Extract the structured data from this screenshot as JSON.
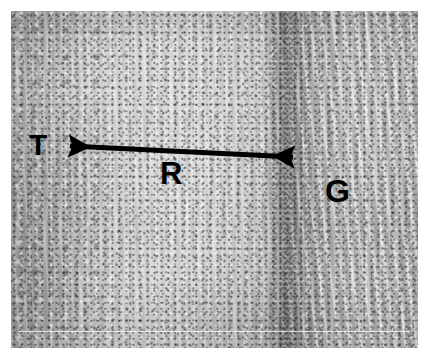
{
  "figure": {
    "kind": "histology-micrograph",
    "modality": "light microscopy, H&E-like grayscale tissue section",
    "background_color": "#ffffff",
    "annotation_color": "#000000",
    "canvas": {
      "x": 11,
      "y": 11,
      "width": 407,
      "height": 337
    },
    "tone_zones": [
      {
        "name": "tumor",
        "side": "left",
        "color": "#9b9b9b",
        "description": "darker, coarsely mottled cellular tissue"
      },
      {
        "name": "reactive",
        "side": "center",
        "color": "#d8d8d8",
        "description": "pale finely stippled band"
      },
      {
        "name": "interface",
        "side": "right-of-center",
        "color": "#aeaeae",
        "description": "dense hypercellular dark vertical band"
      },
      {
        "name": "gliotic",
        "side": "right",
        "color": "#bdbdbd",
        "description": "medium gray fibrillary streaked tissue"
      }
    ],
    "scale_line": {
      "color": "#f8f7e9",
      "y": 320
    }
  },
  "annotations": {
    "arrow": {
      "name": "double-headed-arrow",
      "label": "R",
      "color": "#000000",
      "stroke_width": 5,
      "start": {
        "x": 63,
        "y": 146
      },
      "end": {
        "x": 300,
        "y": 157
      },
      "heads": "both"
    },
    "labels": [
      {
        "id": "T",
        "text": "T",
        "meaning": "tumor",
        "x": 29,
        "y": 130,
        "font_size": 30
      },
      {
        "id": "R",
        "text": "R",
        "meaning": "reactive zone spanned by arrow",
        "x": 160,
        "y": 158,
        "font_size": 31
      },
      {
        "id": "G",
        "text": "G",
        "meaning": "gliotic tissue",
        "x": 325,
        "y": 175,
        "font_size": 32
      }
    ]
  }
}
